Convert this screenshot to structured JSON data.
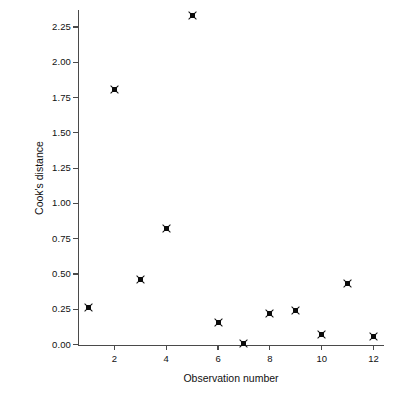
{
  "chart_data": {
    "type": "scatter",
    "title": "",
    "xlabel": "Observation number",
    "ylabel": "Cook's distance",
    "x": [
      1,
      2,
      3,
      4,
      5,
      6,
      7,
      8,
      9,
      10,
      11,
      12
    ],
    "values": [
      0.26,
      1.81,
      0.46,
      0.82,
      2.33,
      0.16,
      0.01,
      0.22,
      0.24,
      0.07,
      0.43,
      0.06
    ],
    "series": [
      {
        "name": "Cook's distance",
        "points": [
          {
            "x": 1,
            "y": 0.26
          },
          {
            "x": 2,
            "y": 1.81
          },
          {
            "x": 3,
            "y": 0.46
          },
          {
            "x": 4,
            "y": 0.82
          },
          {
            "x": 5,
            "y": 2.33
          },
          {
            "x": 6,
            "y": 0.16
          },
          {
            "x": 7,
            "y": 0.01
          },
          {
            "x": 8,
            "y": 0.22
          },
          {
            "x": 9,
            "y": 0.24
          },
          {
            "x": 10,
            "y": 0.07
          },
          {
            "x": 11,
            "y": 0.43
          },
          {
            "x": 12,
            "y": 0.06
          }
        ]
      }
    ],
    "xlim": [
      0.6,
      12.4
    ],
    "ylim": [
      0.0,
      2.37
    ],
    "xticks": [
      2,
      4,
      6,
      8,
      10,
      12
    ],
    "xtick_labels": [
      "2",
      "4",
      "6",
      "8",
      "10",
      "12"
    ],
    "yticks": [
      0.0,
      0.25,
      0.5,
      0.75,
      1.0,
      1.25,
      1.5,
      1.75,
      2.0,
      2.25
    ],
    "ytick_labels": [
      "0.00",
      "0.25",
      "0.50",
      "0.75",
      "1.00",
      "1.25",
      "1.50",
      "1.75",
      "2.00",
      "2.25"
    ],
    "grid": false,
    "legend": null,
    "marker": "square-x",
    "marker_color": "#0b0b0b",
    "axis_color": "#4a4a4a",
    "background": "#ffffff"
  }
}
